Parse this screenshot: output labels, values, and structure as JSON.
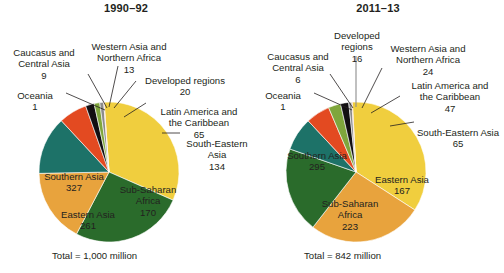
{
  "chart_data": [
    {
      "type": "pie",
      "title": "1990–92",
      "total_label": "Total = 1,000 million",
      "total_value": 1000,
      "unit": "million",
      "legend": "none",
      "categories": [
        "Southern Asia",
        "Eastern Asia",
        "Sub-Saharan Africa",
        "South-Eastern Asia",
        "Latin America and the Caribbean",
        "Developed regions",
        "Western Asia and Northern Africa",
        "Caucasus and Central Asia",
        "Oceania"
      ],
      "values": [
        327,
        261,
        170,
        134,
        65,
        20,
        13,
        9,
        1
      ],
      "slices": [
        {
          "name": "Southern Asia",
          "value": 327,
          "label": "Southern Asia",
          "value_text": "327",
          "color": "#F0CE3E",
          "inside": true
        },
        {
          "name": "Eastern Asia",
          "value": 261,
          "label": "Eastern Asia",
          "value_text": "261",
          "color": "#2A6B2B",
          "inside": true
        },
        {
          "name": "Sub-Saharan Africa",
          "value": 170,
          "label": "Sub-Saharan\nAfrica",
          "value_text": "170",
          "color": "#E8A33D",
          "inside": true
        },
        {
          "name": "South-Eastern Asia",
          "value": 134,
          "label": "South-Eastern Asia",
          "value_text": "134",
          "color": "#1D7268",
          "inside": false
        },
        {
          "name": "Latin America and the Caribbean",
          "value": 65,
          "label": "Latin America and\nthe Caribbean",
          "value_text": "65",
          "color": "#E34A21",
          "inside": false
        },
        {
          "name": "Developed regions",
          "value": 20,
          "label": "Developed regions",
          "value_text": "20",
          "color": "#120F12",
          "inside": false
        },
        {
          "name": "Western Asia and Northern Africa",
          "value": 13,
          "label": "Western Asia and\nNorthern Africa",
          "value_text": "13",
          "color": "#7FA63C",
          "inside": false
        },
        {
          "name": "Caucasus and Central Asia",
          "value": 9,
          "label": "Caucasus and\nCentral Asia",
          "value_text": "9",
          "color": "#8C8C8C",
          "inside": false
        },
        {
          "name": "Oceania",
          "value": 1,
          "label": "Oceania",
          "value_text": "1",
          "color": "#E06A1E",
          "inside": false
        }
      ]
    },
    {
      "type": "pie",
      "title": "2011–13",
      "total_label": "Total = 842 million",
      "total_value": 842,
      "unit": "million",
      "legend": "none",
      "categories": [
        "Southern Asia",
        "Sub-Saharan Africa",
        "Eastern Asia",
        "South-Eastern Asia",
        "Latin America and the Caribbean",
        "Western Asia and Northern Africa",
        "Developed regions",
        "Caucasus and Central Asia",
        "Oceania"
      ],
      "values": [
        295,
        223,
        167,
        65,
        47,
        24,
        16,
        6,
        1
      ],
      "slices": [
        {
          "name": "Southern Asia",
          "value": 295,
          "label": "Southern Asia",
          "value_text": "295",
          "color": "#F0CE3E",
          "inside": true
        },
        {
          "name": "Sub-Saharan Africa",
          "value": 223,
          "label": "Sub-Saharan\nAfrica",
          "value_text": "223",
          "color": "#E8A33D",
          "inside": true
        },
        {
          "name": "Eastern Asia",
          "value": 167,
          "label": "Eastern Asia",
          "value_text": "167",
          "color": "#2A6B2B",
          "inside": true
        },
        {
          "name": "South-Eastern Asia",
          "value": 65,
          "label": "South-Eastern Asia",
          "value_text": "65",
          "color": "#1D7268",
          "inside": false
        },
        {
          "name": "Latin America and the Caribbean",
          "value": 47,
          "label": "Latin America and\nthe Caribbean",
          "value_text": "47",
          "color": "#E34A21",
          "inside": false
        },
        {
          "name": "Western Asia and Northern Africa",
          "value": 24,
          "label": "Western Asia and\nNorthern Africa",
          "value_text": "24",
          "color": "#7FA63C",
          "inside": false
        },
        {
          "name": "Developed regions",
          "value": 16,
          "label": "Developed\nregions",
          "value_text": "16",
          "color": "#120F12",
          "inside": false
        },
        {
          "name": "Caucasus and Central Asia",
          "value": 6,
          "label": "Caucasus and\nCentral Asia",
          "value_text": "6",
          "color": "#8C8C8C",
          "inside": false
        },
        {
          "name": "Oceania",
          "value": 1,
          "label": "Oceania",
          "value_text": "1",
          "color": "#E06A1E",
          "inside": false
        }
      ]
    }
  ],
  "left": {
    "title": "1990–92",
    "total": "Total = 1,000 million",
    "labels": {
      "caucasus": "Caucasus and\nCentral Asia",
      "caucasus_value": "9",
      "oceania": "Oceania",
      "oceania_value": "1",
      "western": "Western Asia and\nNorthern Africa",
      "western_value": "13",
      "developed": "Developed regions",
      "developed_value": "20",
      "latin": "Latin America and\nthe Caribbean",
      "latin_value": "65",
      "southeastern": "South-Eastern Asia",
      "southeastern_value": "134",
      "southern": "Southern Asia",
      "southern_value": "327",
      "eastern": "Eastern Asia",
      "eastern_value": "261",
      "subsaharan": "Sub-Saharan\nAfrica",
      "subsaharan_value": "170"
    }
  },
  "right": {
    "title": "2011–13",
    "total": "Total = 842 million",
    "labels": {
      "caucasus": "Caucasus and\nCentral Asia",
      "caucasus_value": "6",
      "oceania": "Oceania",
      "oceania_value": "1",
      "developed": "Developed\nregions",
      "developed_value": "16",
      "western": "Western Asia and\nNorthern Africa",
      "western_value": "24",
      "latin": "Latin America and\nthe Caribbean",
      "latin_value": "47",
      "southeastern": "South-Eastern Asia",
      "southeastern_value": "65",
      "southern": "Southern Asia",
      "southern_value": "295",
      "subsaharan": "Sub-Saharan\nAfrica",
      "subsaharan_value": "223",
      "eastern": "Eastern Asia",
      "eastern_value": "167"
    }
  }
}
